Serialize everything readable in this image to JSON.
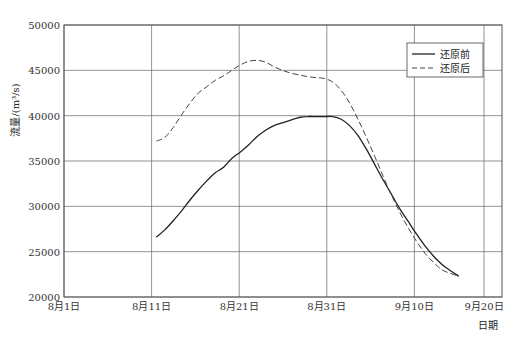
{
  "chart_data": {
    "type": "line",
    "title": "",
    "xlabel": "日期",
    "ylabel": "流量/(m³/s)",
    "ylim": [
      20000,
      50000
    ],
    "yticks": [
      20000,
      25000,
      30000,
      35000,
      40000,
      45000,
      50000
    ],
    "xtick_labels": [
      "8月1日",
      "8月11日",
      "8月21日",
      "8月31日",
      "9月10日",
      "9月20日"
    ],
    "xlim_days": [
      0,
      50
    ],
    "grid": true,
    "legend": {
      "position": "upper right",
      "entries": [
        "还原前",
        "还原后"
      ]
    },
    "series": [
      {
        "name": "还原前",
        "style": "solid",
        "x_days": [
          11,
          12,
          13,
          14,
          15,
          16,
          17,
          18,
          19,
          20,
          21,
          22,
          23,
          24,
          25,
          26,
          27,
          28,
          29,
          30,
          31,
          32,
          33,
          34,
          35,
          36,
          37,
          38,
          39,
          40,
          41,
          42,
          43,
          44,
          45,
          46,
          47
        ],
        "values": [
          26600,
          27400,
          28400,
          29500,
          30700,
          31800,
          32800,
          33700,
          34300,
          35300,
          36000,
          36800,
          37700,
          38400,
          38900,
          39200,
          39500,
          39800,
          39900,
          39900,
          39900,
          39900,
          39600,
          38900,
          37800,
          36300,
          34600,
          32900,
          31300,
          29700,
          28300,
          26900,
          25600,
          24500,
          23600,
          22900,
          22300
        ]
      },
      {
        "name": "还原后",
        "style": "dashed",
        "x_days": [
          11,
          12,
          13,
          14,
          15,
          16,
          17,
          18,
          19,
          20,
          21,
          22,
          23,
          24,
          25,
          26,
          27,
          28,
          29,
          30,
          31,
          32,
          33,
          34,
          35,
          36,
          37,
          38,
          39,
          40,
          41,
          42,
          43,
          44,
          45,
          46,
          47
        ],
        "values": [
          37200,
          37600,
          38700,
          40100,
          41400,
          42500,
          43200,
          43900,
          44400,
          45000,
          45600,
          46000,
          46100,
          45900,
          45400,
          45000,
          44700,
          44500,
          44300,
          44200,
          44100,
          43700,
          42800,
          41400,
          39600,
          37600,
          35500,
          33300,
          31200,
          29300,
          27600,
          26100,
          24800,
          23800,
          23000,
          22600,
          22300
        ]
      }
    ]
  },
  "axis": {
    "ylabel": "流量/(m³/s)",
    "xlabel": "日期"
  },
  "legend": {
    "entries": [
      "还原前",
      "还原后"
    ]
  }
}
